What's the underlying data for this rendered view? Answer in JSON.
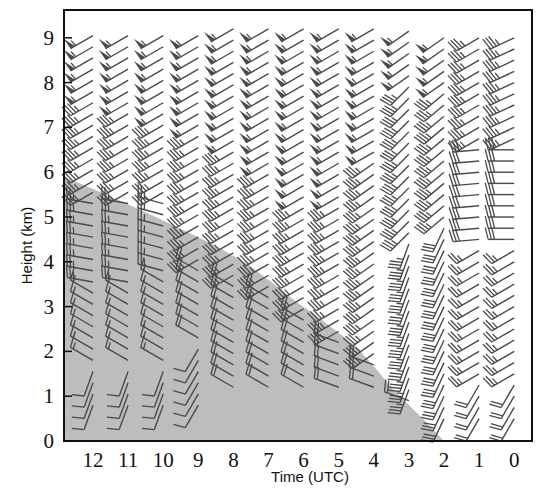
{
  "chart_data": {
    "type": "wind-barb time-height plot",
    "title": "",
    "xlabel": "Time (UTC)",
    "ylabel": "Height (km)",
    "x_ticks": [
      "12",
      "11",
      "10",
      "9",
      "8",
      "7",
      "6",
      "5",
      "4",
      "3",
      "2",
      "1",
      "0"
    ],
    "y_ticks": [
      "0",
      "1",
      "2",
      "3",
      "4",
      "5",
      "6",
      "7",
      "8",
      "9"
    ],
    "ylim": [
      0,
      9.6
    ],
    "xlim_note": "time decreases left to right from 12 to 0 UTC",
    "shaded_region": {
      "description": "grey shaded area below a curve (e.g. precipitation/echo region)",
      "boundary_points": [
        {
          "time": 12.8,
          "height": 5.9
        },
        {
          "time": 9.4,
          "height": 4.7
        },
        {
          "time": 7.7,
          "height": 4.0
        },
        {
          "time": 6.2,
          "height": 3.1
        },
        {
          "time": 4.5,
          "height": 2.1
        },
        {
          "time": 3.4,
          "height": 1.1
        },
        {
          "time": 2.0,
          "height": 0.0
        }
      ],
      "color": "#bdbdbd"
    },
    "columns": [
      {
        "time": 12,
        "min_height": 0.8,
        "max_height": 9.1,
        "profile": [
          {
            "from": 0.8,
            "to": 1.6,
            "dir": 200,
            "speed": 10
          },
          {
            "from": 1.6,
            "to": 3.5,
            "dir": 300,
            "speed": 15
          },
          {
            "from": 3.5,
            "to": 5.5,
            "dir": 280,
            "speed": 25
          },
          {
            "from": 5.5,
            "to": 7.6,
            "dir": 240,
            "speed": 35
          },
          {
            "from": 7.6,
            "to": 9.1,
            "dir": 240,
            "speed": 55
          }
        ]
      },
      {
        "time": 11,
        "min_height": 0.8,
        "max_height": 9.1,
        "profile": [
          {
            "from": 0.8,
            "to": 1.6,
            "dir": 200,
            "speed": 10
          },
          {
            "from": 1.6,
            "to": 3.5,
            "dir": 300,
            "speed": 15
          },
          {
            "from": 3.5,
            "to": 5.5,
            "dir": 280,
            "speed": 25
          },
          {
            "from": 5.5,
            "to": 7.4,
            "dir": 240,
            "speed": 35
          },
          {
            "from": 7.4,
            "to": 9.1,
            "dir": 240,
            "speed": 55
          }
        ]
      },
      {
        "time": 10,
        "min_height": 0.8,
        "max_height": 9.1,
        "profile": [
          {
            "from": 0.8,
            "to": 1.6,
            "dir": 200,
            "speed": 10
          },
          {
            "from": 1.6,
            "to": 3.6,
            "dir": 300,
            "speed": 15
          },
          {
            "from": 3.6,
            "to": 5.3,
            "dir": 285,
            "speed": 25
          },
          {
            "from": 5.3,
            "to": 7.1,
            "dir": 240,
            "speed": 35
          },
          {
            "from": 7.1,
            "to": 9.1,
            "dir": 240,
            "speed": 55
          }
        ]
      },
      {
        "time": 9,
        "min_height": 0.8,
        "max_height": 9.1,
        "profile": [
          {
            "from": 0.8,
            "to": 2.2,
            "dir": 210,
            "speed": 10
          },
          {
            "from": 2.2,
            "to": 4.0,
            "dir": 300,
            "speed": 20
          },
          {
            "from": 4.0,
            "to": 6.8,
            "dir": 240,
            "speed": 35
          },
          {
            "from": 6.8,
            "to": 9.1,
            "dir": 240,
            "speed": 55
          }
        ]
      },
      {
        "time": 8,
        "min_height": 1.2,
        "max_height": 9.2,
        "profile": [
          {
            "from": 1.2,
            "to": 3.5,
            "dir": 300,
            "speed": 20
          },
          {
            "from": 3.5,
            "to": 6.6,
            "dir": 240,
            "speed": 35
          },
          {
            "from": 6.6,
            "to": 9.2,
            "dir": 240,
            "speed": 55
          }
        ]
      },
      {
        "time": 7,
        "min_height": 1.2,
        "max_height": 9.2,
        "profile": [
          {
            "from": 1.2,
            "to": 3.4,
            "dir": 300,
            "speed": 20
          },
          {
            "from": 3.4,
            "to": 6.0,
            "dir": 240,
            "speed": 35
          },
          {
            "from": 6.0,
            "to": 9.2,
            "dir": 240,
            "speed": 55
          }
        ]
      },
      {
        "time": 6,
        "min_height": 1.2,
        "max_height": 9.2,
        "profile": [
          {
            "from": 1.2,
            "to": 2.7,
            "dir": 300,
            "speed": 20
          },
          {
            "from": 2.7,
            "to": 5.2,
            "dir": 240,
            "speed": 35
          },
          {
            "from": 5.2,
            "to": 9.2,
            "dir": 240,
            "speed": 55
          }
        ]
      },
      {
        "time": 5,
        "min_height": 1.2,
        "max_height": 9.2,
        "profile": [
          {
            "from": 1.2,
            "to": 2.2,
            "dir": 290,
            "speed": 20
          },
          {
            "from": 2.2,
            "to": 5.2,
            "dir": 240,
            "speed": 35
          },
          {
            "from": 5.2,
            "to": 9.2,
            "dir": 240,
            "speed": 55
          }
        ]
      },
      {
        "time": 4,
        "min_height": 1.2,
        "max_height": 9.2,
        "profile": [
          {
            "from": 1.2,
            "to": 1.7,
            "dir": 290,
            "speed": 20
          },
          {
            "from": 1.7,
            "to": 6.3,
            "dir": 235,
            "speed": 35
          },
          {
            "from": 6.3,
            "to": 9.2,
            "dir": 240,
            "speed": 55
          }
        ]
      },
      {
        "time": 3,
        "min_height": 0.9,
        "max_height": 9.2,
        "profile": [
          {
            "from": 0.9,
            "to": 1.1,
            "dir": 290,
            "speed": 20
          },
          {
            "from": 1.1,
            "to": 4.5,
            "dir": 200,
            "speed": 35
          },
          {
            "from": 4.5,
            "to": 7.9,
            "dir": 225,
            "speed": 35
          },
          {
            "from": 7.9,
            "to": 9.2,
            "dir": 235,
            "speed": 55
          }
        ]
      },
      {
        "time": 2,
        "min_height": 0.5,
        "max_height": 9.2,
        "profile": [
          {
            "from": 0.5,
            "to": 4.8,
            "dir": 205,
            "speed": 30
          },
          {
            "from": 4.8,
            "to": 7.9,
            "dir": 230,
            "speed": 35
          },
          {
            "from": 7.9,
            "to": 9.2,
            "dir": 235,
            "speed": 55
          }
        ]
      },
      {
        "time": 1,
        "min_height": 0.5,
        "max_height": 9.2,
        "profile": [
          {
            "from": 0.5,
            "to": 1.4,
            "dir": 210,
            "speed": 20
          },
          {
            "from": 1.4,
            "to": 4.4,
            "dir": 240,
            "speed": 25
          },
          {
            "from": 4.4,
            "to": 6.5,
            "dir": 265,
            "speed": 30
          },
          {
            "from": 6.5,
            "to": 9.2,
            "dir": 240,
            "speed": 35
          }
        ]
      },
      {
        "time": 0,
        "min_height": 0.5,
        "max_height": 9.2,
        "profile": [
          {
            "from": 0.5,
            "to": 1.4,
            "dir": 210,
            "speed": 20
          },
          {
            "from": 1.4,
            "to": 4.4,
            "dir": 240,
            "speed": 25
          },
          {
            "from": 4.4,
            "to": 6.5,
            "dir": 270,
            "speed": 30
          },
          {
            "from": 6.5,
            "to": 9.2,
            "dir": 245,
            "speed": 35
          }
        ]
      }
    ],
    "barb_spacing_km": 0.25,
    "barb_convention": "standard meteorological wind barbs; short barb = 5, long barb = 10, pennant = 50",
    "grid": false,
    "legend": null
  },
  "layout": {
    "plot": {
      "left": 64,
      "top": 10,
      "right": 532,
      "bottom": 441
    },
    "y_px_per_km": 44.8,
    "x_first_column": 93,
    "x_column_step": 35.1,
    "barb_color": "#4a4a4a",
    "frame_color": "#111111"
  }
}
